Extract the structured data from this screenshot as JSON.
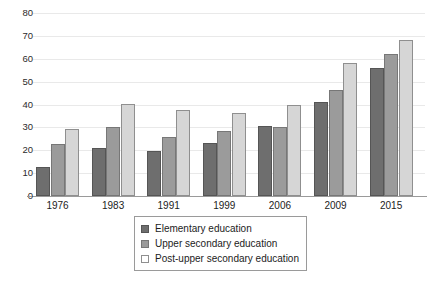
{
  "chart_data": {
    "type": "bar",
    "title": "",
    "subtitle": "",
    "xlabel": "",
    "ylabel": "",
    "categories": [
      "1976",
      "1983",
      "1991",
      "1999",
      "2006",
      "2009",
      "2015"
    ],
    "series": [
      {
        "name": "Elementary education",
        "color": "#6e6e6e",
        "values": [
          12.5,
          21,
          19.7,
          23,
          30.4,
          41,
          56
        ]
      },
      {
        "name": "Upper secondary education",
        "color": "#9b9b9b",
        "values": [
          22.7,
          30.3,
          25.9,
          28.3,
          30,
          46.2,
          62
        ]
      },
      {
        "name": "Post-upper secondary education",
        "color": "#d6d6d6",
        "values": [
          29.4,
          40.2,
          37.4,
          36.4,
          40,
          58,
          68.4
        ]
      }
    ],
    "yticks": [
      0,
      10,
      20,
      30,
      40,
      50,
      60,
      70,
      80
    ],
    "ylim": [
      0,
      80
    ],
    "grid": true,
    "legend_position": "bottom-center"
  }
}
